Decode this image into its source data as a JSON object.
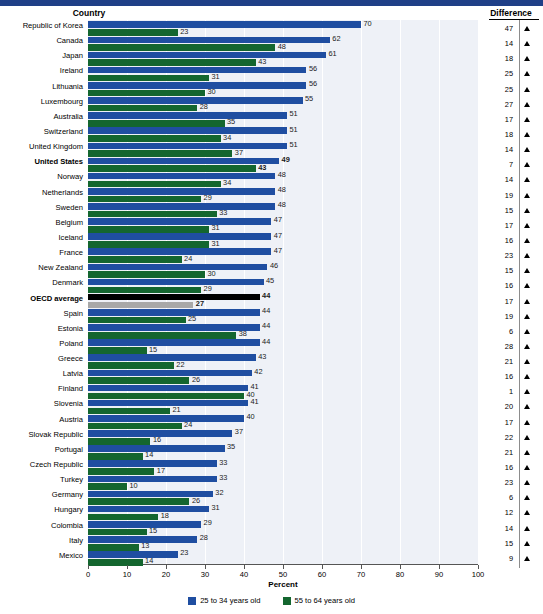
{
  "header": {
    "country_label": "Country",
    "difference_label": "Difference"
  },
  "axis": {
    "title": "Percent",
    "ticks": [
      0,
      10,
      20,
      30,
      40,
      50,
      60,
      70,
      80,
      90,
      100
    ],
    "min": 0,
    "max": 100
  },
  "legend": {
    "position": "bottom-center",
    "items": [
      {
        "label": "25 to 34 years old",
        "color": "#1f4ea1"
      },
      {
        "label": "55 to 64 years old",
        "color": "#14662f"
      }
    ]
  },
  "colors": {
    "young": "#1f4ea1",
    "old": "#14662f",
    "oecd_young": "#000000",
    "oecd_old": "#a8a8a8",
    "plot_background": "#eef1f7",
    "top_band": "#1f3f87"
  },
  "chart_data": {
    "type": "bar",
    "orientation": "horizontal",
    "title": "",
    "xlabel": "Percent",
    "ylabel": "Country",
    "xlim": [
      0,
      100
    ],
    "grid": true,
    "legend_position": "bottom-center",
    "categories": [
      "Republic of Korea",
      "Canada",
      "Japan",
      "Ireland",
      "Lithuania",
      "Luxembourg",
      "Australia",
      "Switzerland",
      "United Kingdom",
      "United States",
      "Norway",
      "Netherlands",
      "Sweden",
      "Belgium",
      "Iceland",
      "France",
      "New Zealand",
      "Denmark",
      "OECD average",
      "Spain",
      "Estonia",
      "Poland",
      "Greece",
      "Latvia",
      "Finland",
      "Slovenia",
      "Austria",
      "Slovak Republic",
      "Portugal",
      "Czech Republic",
      "Turkey",
      "Germany",
      "Hungary",
      "Colombia",
      "Italy",
      "Mexico"
    ],
    "series": [
      {
        "name": "25 to 34 years old",
        "color": "#1f4ea1",
        "values": [
          70,
          62,
          61,
          56,
          56,
          55,
          51,
          51,
          51,
          49,
          48,
          48,
          48,
          47,
          47,
          47,
          46,
          45,
          44,
          44,
          44,
          44,
          43,
          42,
          41,
          41,
          40,
          37,
          35,
          33,
          33,
          32,
          31,
          29,
          28,
          23
        ]
      },
      {
        "name": "55 to 64 years old",
        "color": "#14662f",
        "values": [
          23,
          48,
          43,
          31,
          30,
          28,
          35,
          34,
          37,
          43,
          34,
          29,
          33,
          31,
          31,
          24,
          30,
          29,
          27,
          25,
          38,
          15,
          22,
          26,
          40,
          21,
          24,
          16,
          14,
          17,
          10,
          26,
          18,
          15,
          13,
          14
        ]
      }
    ],
    "difference": [
      47,
      14,
      18,
      25,
      25,
      27,
      17,
      18,
      14,
      7,
      14,
      19,
      15,
      17,
      16,
      23,
      15,
      16,
      17,
      19,
      6,
      28,
      21,
      16,
      1,
      20,
      17,
      22,
      21,
      16,
      23,
      6,
      12,
      14,
      15,
      9
    ],
    "difference_marker": "triangle-up",
    "emphasized_rows": [
      "United States",
      "OECD average"
    ]
  }
}
